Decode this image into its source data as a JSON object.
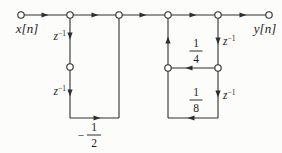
{
  "colors": {
    "background": "#fcfcfb",
    "line": "#2e2e2e",
    "node_fill": "#ffffff",
    "text": "#1c1c1c"
  },
  "diagram": {
    "type": "signal-flow-graph",
    "labels": {
      "input": "x[n]",
      "output": "y[n]",
      "delay_base": "z",
      "delay_sup": "−1"
    },
    "io_positions": {
      "input": {
        "x": 27,
        "y": 33
      },
      "output": {
        "x": 265,
        "y": 33
      }
    },
    "nodes": [
      [
        21,
        15
      ],
      [
        70,
        15
      ],
      [
        119,
        15
      ],
      [
        168,
        15
      ],
      [
        218,
        15
      ],
      [
        269,
        15
      ],
      [
        70,
        67
      ],
      [
        168,
        68
      ],
      [
        218,
        68
      ]
    ],
    "node_radius": 3.2,
    "wires": [
      [
        21,
        15,
        269,
        15
      ],
      [
        70,
        15,
        70,
        118
      ],
      [
        70,
        118,
        119,
        118
      ],
      [
        119,
        118,
        119,
        15
      ],
      [
        168,
        15,
        168,
        118
      ],
      [
        218,
        15,
        218,
        118
      ],
      [
        218,
        68,
        168,
        68
      ],
      [
        218,
        118,
        168,
        118
      ]
    ],
    "arrows": [
      {
        "x": 45,
        "y": 15,
        "dir": "right"
      },
      {
        "x": 95,
        "y": 15,
        "dir": "right"
      },
      {
        "x": 143,
        "y": 15,
        "dir": "right"
      },
      {
        "x": 193,
        "y": 15,
        "dir": "right"
      },
      {
        "x": 243,
        "y": 15,
        "dir": "right"
      },
      {
        "x": 70,
        "y": 36,
        "dir": "down"
      },
      {
        "x": 70,
        "y": 93,
        "dir": "down"
      },
      {
        "x": 97,
        "y": 118,
        "dir": "right"
      },
      {
        "x": 168,
        "y": 40,
        "dir": "up"
      },
      {
        "x": 218,
        "y": 41,
        "dir": "down"
      },
      {
        "x": 218,
        "y": 94,
        "dir": "down"
      },
      {
        "x": 189,
        "y": 68,
        "dir": "left"
      },
      {
        "x": 191,
        "y": 118,
        "dir": "left"
      }
    ],
    "delay_labels": [
      {
        "x": 66,
        "y": 40,
        "anchor": "end"
      },
      {
        "x": 66,
        "y": 95,
        "anchor": "end"
      },
      {
        "x": 223,
        "y": 45,
        "anchor": "start"
      },
      {
        "x": 223,
        "y": 99,
        "anchor": "start"
      }
    ],
    "coefficients": [
      {
        "id": "minus-one-half",
        "sign": "−",
        "num": "1",
        "den": "2",
        "x": 94,
        "bar_y": 135,
        "bar_w": 14,
        "sign_x": 81
      },
      {
        "id": "one-quarter",
        "sign": "",
        "num": "1",
        "den": "4",
        "x": 196,
        "bar_y": 51,
        "bar_w": 13,
        "sign_x": 0
      },
      {
        "id": "one-eighth",
        "sign": "",
        "num": "1",
        "den": "8",
        "x": 196,
        "bar_y": 100,
        "bar_w": 13,
        "sign_x": 0
      }
    ]
  }
}
